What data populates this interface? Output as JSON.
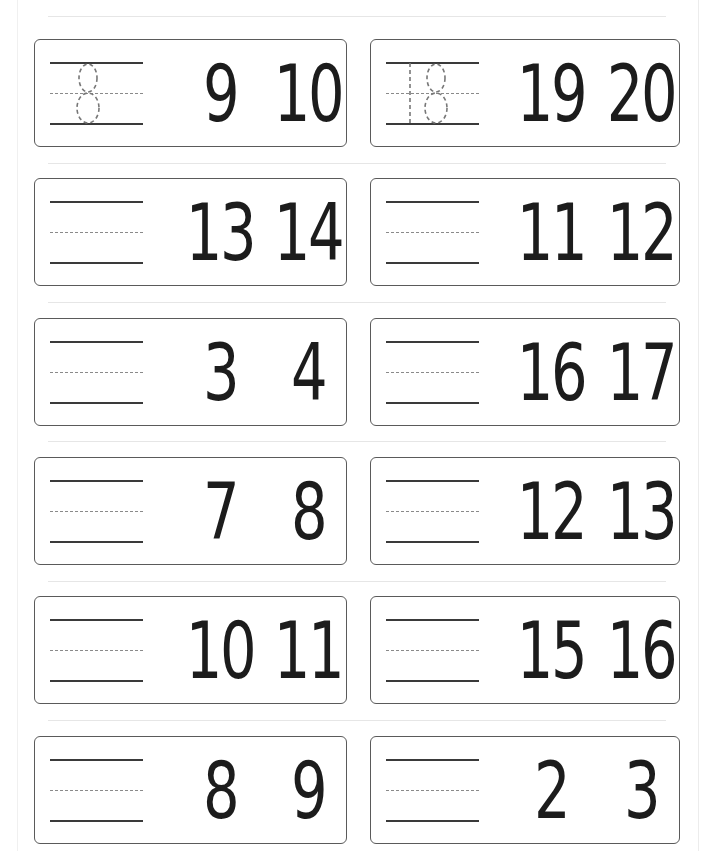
{
  "worksheet": {
    "type": "number-before-practice",
    "rows": [
      {
        "left": {
          "answer": "8",
          "traced": true,
          "numbers": [
            "9",
            "10"
          ]
        },
        "right": {
          "answer": "18",
          "traced": true,
          "numbers": [
            "19",
            "20"
          ]
        }
      },
      {
        "left": {
          "answer": "",
          "traced": false,
          "numbers": [
            "13",
            "14"
          ]
        },
        "right": {
          "answer": "",
          "traced": false,
          "numbers": [
            "11",
            "12"
          ]
        }
      },
      {
        "left": {
          "answer": "",
          "traced": false,
          "numbers": [
            "3",
            "4"
          ]
        },
        "right": {
          "answer": "",
          "traced": false,
          "numbers": [
            "16",
            "17"
          ]
        }
      },
      {
        "left": {
          "answer": "",
          "traced": false,
          "numbers": [
            "7",
            "8"
          ]
        },
        "right": {
          "answer": "",
          "traced": false,
          "numbers": [
            "12",
            "13"
          ]
        }
      },
      {
        "left": {
          "answer": "",
          "traced": false,
          "numbers": [
            "10",
            "11"
          ]
        },
        "right": {
          "answer": "",
          "traced": false,
          "numbers": [
            "15",
            "16"
          ]
        }
      },
      {
        "left": {
          "answer": "",
          "traced": false,
          "numbers": [
            "8",
            "9"
          ]
        },
        "right": {
          "answer": "",
          "traced": false,
          "numbers": [
            "2",
            "3"
          ]
        }
      }
    ]
  },
  "colors": {
    "card_border": "#5a5a5a",
    "digit": "#1c1c1c",
    "guide_line": "#3a3a3a",
    "dashed_line": "#8a8a8a",
    "trace": "#777777",
    "separator": "#e6e6e6"
  }
}
